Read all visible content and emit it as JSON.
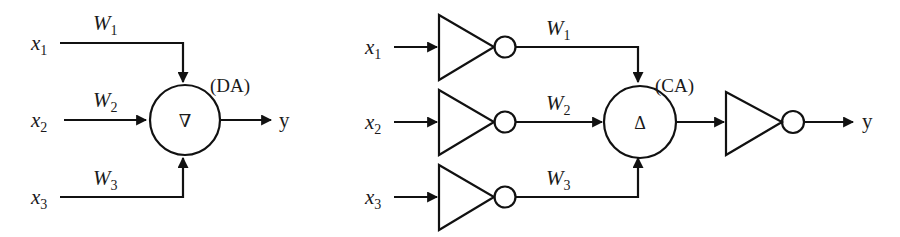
{
  "diagram": {
    "left": {
      "name": "discrete-adder-neuron",
      "node_label": "(DA)",
      "node_symbol": "∇",
      "inputs": [
        {
          "var": "x",
          "sub": "1",
          "weight": "W",
          "wsub": "1"
        },
        {
          "var": "x",
          "sub": "2",
          "weight": "W",
          "wsub": "2"
        },
        {
          "var": "x",
          "sub": "3",
          "weight": "W",
          "wsub": "3"
        }
      ],
      "output": "y"
    },
    "right": {
      "name": "complementary-adder-neuron",
      "node_label": "(CA)",
      "node_symbol": "Δ",
      "inputs": [
        {
          "var": "x",
          "sub": "1",
          "weight": "W",
          "wsub": "1"
        },
        {
          "var": "x",
          "sub": "2",
          "weight": "W",
          "wsub": "2"
        },
        {
          "var": "x",
          "sub": "3",
          "weight": "W",
          "wsub": "3"
        }
      ],
      "output": "y"
    },
    "colors": {
      "stroke": "#111111",
      "background": "#ffffff"
    }
  }
}
